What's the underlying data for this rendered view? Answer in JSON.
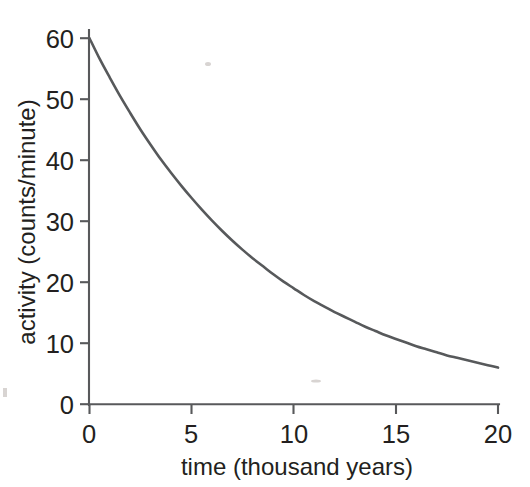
{
  "chart_data": {
    "type": "line",
    "title": "",
    "subtitle": "",
    "xlabel": "time (thousand years)",
    "ylabel": "activity (counts/minute)",
    "xlim": [
      0,
      20
    ],
    "ylim": [
      0,
      62
    ],
    "xticks": [
      0,
      5,
      10,
      15,
      20
    ],
    "xticklabels": [
      "0",
      "5",
      "10",
      "15",
      "20"
    ],
    "yticks": [
      0,
      10,
      20,
      30,
      40,
      50,
      60
    ],
    "yticklabels": [
      "0",
      "10",
      "20",
      "30",
      "40",
      "50",
      "60"
    ],
    "grid": false,
    "legend": false,
    "legend_position": "none",
    "annotations": [],
    "series": [
      {
        "name": "radioactive decay activity",
        "color": "#57595b",
        "line_width": 2.6,
        "x": [
          0,
          0.5,
          1,
          1.5,
          2,
          2.5,
          3,
          3.5,
          4,
          4.5,
          5,
          5.5,
          6,
          6.5,
          7,
          7.5,
          8,
          8.5,
          9,
          9.5,
          10,
          10.5,
          11,
          11.5,
          12,
          12.5,
          13,
          13.5,
          14,
          14.5,
          15,
          15.5,
          16,
          16.5,
          17,
          17.5,
          18,
          18.5,
          19,
          19.5,
          20
        ],
        "values": [
          60.0,
          56.6,
          53.5,
          50.5,
          47.7,
          45.0,
          42.5,
          40.1,
          37.9,
          35.8,
          33.8,
          31.9,
          30.1,
          28.4,
          26.8,
          25.3,
          23.9,
          22.6,
          21.3,
          20.1,
          19.0,
          17.9,
          16.9,
          16.0,
          15.1,
          14.3,
          13.5,
          12.7,
          12.0,
          11.3,
          10.7,
          10.1,
          9.5,
          9.0,
          8.5,
          8.0,
          7.6,
          7.2,
          6.8,
          6.4,
          6.0
        ]
      }
    ],
    "notes": {
      "curve_shape": "exponential decay",
      "initial_activity": 60,
      "final_activity": 6,
      "half_life_thousand_years": 6.0,
      "y_axis_units": "counts/minute",
      "x_axis_units": "thousand years"
    }
  },
  "axis_labels": {
    "x_title": "time (thousand years)",
    "y_title": "activity (counts/minute)"
  },
  "ticks": {
    "y": [
      "60",
      "50",
      "40",
      "30",
      "20",
      "10",
      "0"
    ],
    "x": [
      "0",
      "5",
      "10",
      "15",
      "20"
    ]
  },
  "colors": {
    "curve": "#57595b",
    "axis": "#58595b",
    "text": "#231f20",
    "background": "#ffffff"
  }
}
